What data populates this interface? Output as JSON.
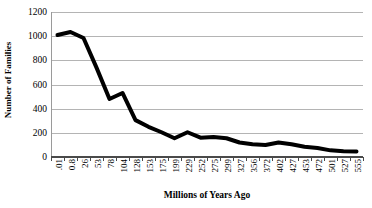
{
  "chart_data": {
    "type": "line",
    "title": "",
    "xlabel": "Millions of Years Ago",
    "ylabel": "Number of Families",
    "categories": [
      ".01",
      "0.8",
      "26",
      "53",
      "78",
      "104",
      "128",
      "153",
      "175",
      "199",
      "229",
      "252",
      "275",
      "299",
      "327",
      "356",
      "372",
      "402",
      "427",
      "453",
      "472",
      "501",
      "527",
      "555"
    ],
    "values": [
      1010,
      1035,
      985,
      740,
      480,
      530,
      305,
      250,
      205,
      155,
      205,
      160,
      165,
      155,
      120,
      105,
      100,
      120,
      105,
      85,
      75,
      55,
      48,
      45
    ],
    "series": [
      {
        "name": "Number of Families",
        "values": [
          1010,
          1035,
          985,
          740,
          480,
          530,
          305,
          250,
          205,
          155,
          205,
          160,
          165,
          155,
          120,
          105,
          100,
          120,
          105,
          85,
          75,
          55,
          48,
          45
        ]
      }
    ],
    "ylim": [
      0,
      1200
    ],
    "y_ticks": [
      0,
      200,
      400,
      600,
      800,
      1000,
      1200
    ],
    "y_tick_labels": [
      "0",
      "200",
      "400",
      "600",
      "800",
      "1000",
      "1200"
    ],
    "grid": "horizontal",
    "legend": "none",
    "line_color": "#000000",
    "line_width": 4,
    "gridline_color": "#b4b4b4",
    "background_color": "#ffffff"
  }
}
